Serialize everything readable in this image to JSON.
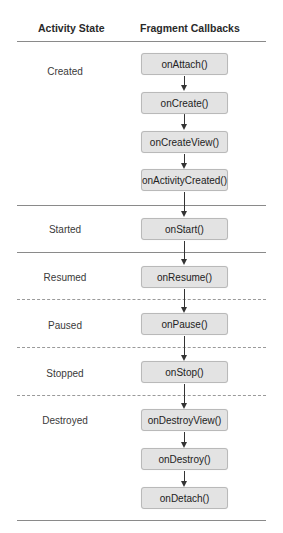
{
  "headers": {
    "activity_state": "Activity State",
    "fragment_callbacks": "Fragment Callbacks"
  },
  "states": [
    {
      "label": "Created",
      "y": 66
    },
    {
      "label": "Started",
      "y": 224
    },
    {
      "label": "Resumed",
      "y": 272
    },
    {
      "label": "Paused",
      "y": 320
    },
    {
      "label": "Stopped",
      "y": 368
    },
    {
      "label": "Destroyed",
      "y": 416
    }
  ],
  "callbacks": [
    {
      "label": "onAttach()",
      "state": "Created"
    },
    {
      "label": "onCreate()",
      "state": "Created"
    },
    {
      "label": "onCreateView()",
      "state": "Created"
    },
    {
      "label": "onActivityCreated()",
      "state": "Created"
    },
    {
      "label": "onStart()",
      "state": "Started"
    },
    {
      "label": "onResume()",
      "state": "Resumed"
    },
    {
      "label": "onPause()",
      "state": "Paused"
    },
    {
      "label": "onStop()",
      "state": "Stopped"
    },
    {
      "label": "onDestroyView()",
      "state": "Destroyed"
    },
    {
      "label": "onDestroy()",
      "state": "Destroyed"
    },
    {
      "label": "onDetach()",
      "state": "Destroyed"
    }
  ],
  "colors": {
    "box_fill": "#e3e3e3",
    "box_border": "#b9b9b9",
    "divider": "#8a8a8a",
    "arrow": "#333333"
  }
}
